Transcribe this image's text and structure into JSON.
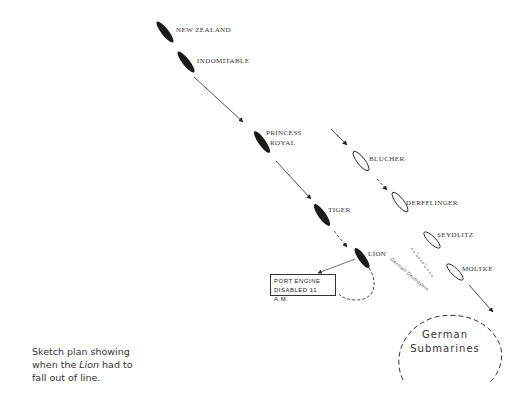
{
  "diagram": {
    "title": "Sketch plan showing when the Lion had to fall out of line",
    "british_ships": [
      {
        "name": "NEW ZEALAND",
        "x": 165,
        "y": 32
      },
      {
        "name": "INDOMITABLE",
        "x": 186,
        "y": 62
      },
      {
        "name": "PRINCESS ROYAL",
        "x": 262,
        "y": 142
      },
      {
        "name": "TIGER",
        "x": 322,
        "y": 215
      },
      {
        "name": "LION",
        "x": 362,
        "y": 258
      }
    ],
    "german_ships": [
      {
        "name": "BLUCHER",
        "x": 361,
        "y": 161
      },
      {
        "name": "DERFFLINGER",
        "x": 400,
        "y": 202
      },
      {
        "name": "SEYDLITZ",
        "x": 432,
        "y": 240
      },
      {
        "name": "MOLTKE",
        "x": 455,
        "y": 272
      }
    ],
    "labels": {
      "new_zealand": "NEW ZEALAND",
      "indomitable": "INDOMITABLE",
      "princess_royal_1": "PRINCESS",
      "princess_royal_2": "ROYAL",
      "tiger": "TIGER",
      "lion": "LION",
      "blucher": "BLUCHER",
      "derfflinger": "DERFFLINGER",
      "seydlitz": "SEYDLITZ",
      "moltke": "MOLTKE",
      "german_destroyers": "German Destroyers",
      "port_engine_line1": "PORT ENGINE",
      "port_engine_line2": "DISABLED 11 A.M.",
      "submarines_line1": "German",
      "submarines_line2": "Submarines"
    },
    "caption": {
      "before": "Sketch plan showing when the ",
      "italic": "Lion",
      "after": " had to fall out of line."
    },
    "colors": {
      "ink": "#222222",
      "background": "#ffffff"
    }
  }
}
